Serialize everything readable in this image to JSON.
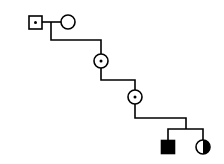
{
  "diagram": {
    "type": "pedigree",
    "stroke_color": "#000000",
    "background": "#ffffff",
    "individuals": [
      {
        "id": "I-1",
        "sex": "male",
        "status": "carrier (dot)",
        "cx": 35,
        "cy": 22
      },
      {
        "id": "I-2",
        "sex": "female",
        "status": "unaffected",
        "cx": 68,
        "cy": 22
      },
      {
        "id": "II-1",
        "sex": "female",
        "status": "carrier (dot)",
        "cx": 101,
        "cy": 61
      },
      {
        "id": "III-1",
        "sex": "female",
        "status": "carrier (dot)",
        "cx": 135,
        "cy": 97
      },
      {
        "id": "IV-1",
        "sex": "male",
        "status": "affected (filled)",
        "cx": 168,
        "cy": 147
      },
      {
        "id": "IV-2",
        "sex": "female",
        "status": "half-filled (right)",
        "cx": 203,
        "cy": 147
      }
    ]
  }
}
